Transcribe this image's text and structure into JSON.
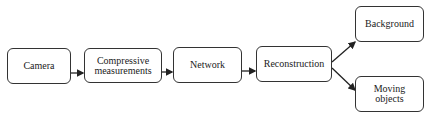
{
  "diagram": {
    "nodes": [
      {
        "id": "camera",
        "label": "Camera"
      },
      {
        "id": "compressive",
        "label": "Compressive measurements"
      },
      {
        "id": "network",
        "label": "Network"
      },
      {
        "id": "reconstruction",
        "label": "Reconstruction"
      },
      {
        "id": "background",
        "label": "Background"
      },
      {
        "id": "moving",
        "label": "Moving objects"
      }
    ],
    "edges": [
      {
        "from": "camera",
        "to": "compressive"
      },
      {
        "from": "compressive",
        "to": "network"
      },
      {
        "from": "network",
        "to": "reconstruction"
      },
      {
        "from": "reconstruction",
        "to": "background"
      },
      {
        "from": "reconstruction",
        "to": "moving"
      }
    ],
    "colors": {
      "stroke": "#333333",
      "fill": "#ffffff",
      "text": "#222222"
    }
  }
}
